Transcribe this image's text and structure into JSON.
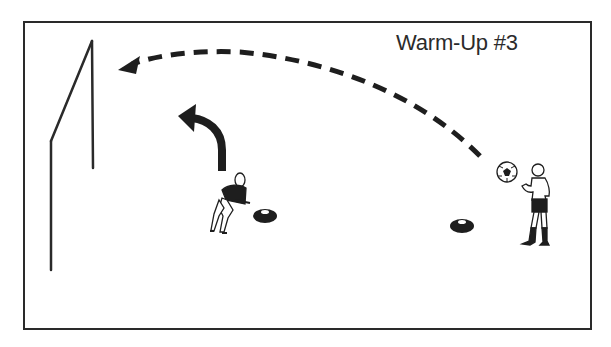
{
  "diagram": {
    "title": "Warm-Up #3",
    "colors": {
      "line": "#2a2a2a",
      "fill_dark": "#1e1e1e",
      "background": "#ffffff"
    },
    "elements": [
      {
        "type": "field-border"
      },
      {
        "type": "goal",
        "side": "left"
      },
      {
        "type": "pass-path",
        "style": "dashed-arrow",
        "from": "ball",
        "to": "top-of-goal"
      },
      {
        "type": "movement-arrow",
        "style": "solid-curved",
        "owner": "goalkeeper"
      },
      {
        "type": "player",
        "role": "goalkeeper",
        "position": "left"
      },
      {
        "type": "cone",
        "position": "near-goalkeeper"
      },
      {
        "type": "cone",
        "position": "middle-right"
      },
      {
        "type": "ball",
        "position": "right"
      },
      {
        "type": "player",
        "role": "server",
        "position": "right"
      }
    ]
  }
}
